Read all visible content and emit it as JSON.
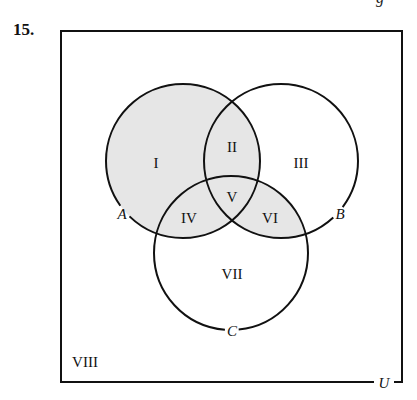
{
  "problem": {
    "number": "15.",
    "cutoff_glyph": "g"
  },
  "diagram": {
    "type": "venn-3-set",
    "universe": {
      "label": "U",
      "rect": {
        "x": 61,
        "y": 31,
        "width": 341,
        "height": 351
      },
      "label_pos": {
        "x": 384,
        "y": 383
      }
    },
    "shade_color": "#e6e6e6",
    "stroke_color": "#111111",
    "sets": [
      {
        "name": "A",
        "label": "A",
        "cx": 183,
        "cy": 161,
        "r": 77,
        "label_pos": {
          "x": 122,
          "y": 214
        }
      },
      {
        "name": "B",
        "label": "B",
        "cx": 281,
        "cy": 161,
        "r": 77,
        "label_pos": {
          "x": 340,
          "y": 214
        }
      },
      {
        "name": "C",
        "label": "C",
        "cx": 231,
        "cy": 253,
        "r": 77,
        "label_pos": {
          "x": 232,
          "y": 331
        }
      }
    ],
    "regions": [
      {
        "id": "I",
        "label": "I",
        "description": "A only",
        "shaded": true,
        "pos": {
          "x": 156,
          "y": 163
        }
      },
      {
        "id": "II",
        "label": "II",
        "description": "A and B, not C",
        "shaded": true,
        "pos": {
          "x": 232,
          "y": 147
        }
      },
      {
        "id": "III",
        "label": "III",
        "description": "B only",
        "shaded": false,
        "pos": {
          "x": 301,
          "y": 163
        }
      },
      {
        "id": "IV",
        "label": "IV",
        "description": "A and C, not B",
        "shaded": true,
        "pos": {
          "x": 189,
          "y": 218
        }
      },
      {
        "id": "V",
        "label": "V",
        "description": "A and B and C",
        "shaded": true,
        "pos": {
          "x": 232,
          "y": 197
        }
      },
      {
        "id": "VI",
        "label": "VI",
        "description": "B and C, not A",
        "shaded": true,
        "pos": {
          "x": 270,
          "y": 218
        }
      },
      {
        "id": "VII",
        "label": "VII",
        "description": "C only",
        "shaded": false,
        "pos": {
          "x": 232,
          "y": 274
        }
      },
      {
        "id": "VIII",
        "label": "VIII",
        "description": "outside A, B, C",
        "shaded": false,
        "pos": {
          "x": 85,
          "y": 362
        }
      }
    ],
    "shaded_expression": "A ∪ (B ∩ C)"
  }
}
